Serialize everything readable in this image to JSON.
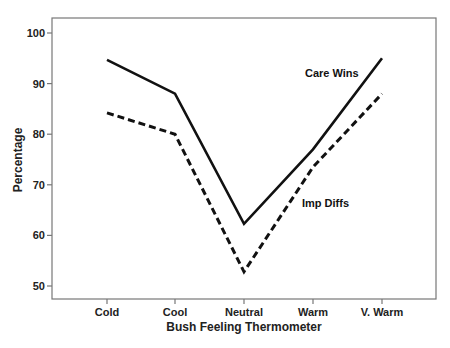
{
  "chart_data": {
    "type": "line",
    "title": "",
    "xlabel": "Bush Feeling Thermometer",
    "ylabel": "Percentage",
    "categories": [
      "Cold",
      "Cool",
      "Neutral",
      "Warm",
      "V. Warm"
    ],
    "ylim": [
      47,
      103
    ],
    "yticks": [
      50,
      60,
      70,
      80,
      90,
      100
    ],
    "grid": false,
    "legend": "inline labels",
    "series": [
      {
        "name": "Care Wins",
        "style": "solid",
        "color": "#111111",
        "values": [
          94.7,
          88.0,
          62.3,
          77.0,
          95.0
        ]
      },
      {
        "name": "Imp Diffs",
        "style": "dashed",
        "color": "#111111",
        "values": [
          84.2,
          80.0,
          52.8,
          73.5,
          88.0
        ]
      }
    ],
    "annotations": [
      {
        "text": "Care Wins",
        "series": "Care Wins"
      },
      {
        "text": "Imp Diffs",
        "series": "Imp Diffs"
      }
    ]
  }
}
